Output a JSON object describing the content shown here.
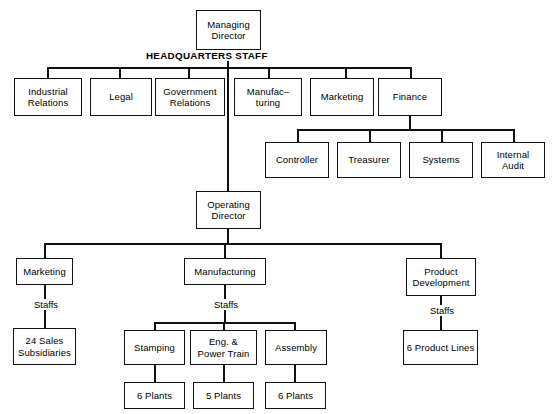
{
  "chart": {
    "type": "org-chart",
    "headquarters_label": "HEADQUARTERS STAFF",
    "staff_label": "Staffs",
    "nodes": {
      "managing_director": "Managing\nDirector",
      "industrial_relations": "Industrial\nRelations",
      "legal": "Legal",
      "government_relations": "Government\nRelations",
      "manufacturing_hq": "Manufac–\nturing",
      "marketing_hq": "Marketing",
      "finance": "Finance",
      "controller": "Controller",
      "treasurer": "Treasurer",
      "systems": "Systems",
      "internal_audit": "Internal\nAudit",
      "operating_director": "Operating\nDirector",
      "marketing_ops": "Marketing",
      "manufacturing_ops": "Manufacturing",
      "product_development": "Product\nDevelopment",
      "sales_subsidiaries": "24 Sales\nSubsidiaries",
      "stamping": "Stamping",
      "eng_power_train": "Eng. &\nPower Train",
      "assembly": "Assembly",
      "product_lines": "6 Product Lines",
      "stamping_plants": "6 Plants",
      "eng_plants": "5 Plants",
      "assembly_plants": "6 Plants"
    },
    "staff_labels": {
      "marketing_staffs": "Staffs",
      "manufacturing_staffs": "Staffs",
      "product_dev_staffs": "Staffs"
    },
    "colors": {
      "line": "#111111",
      "box_fill": "#ffffff",
      "text": "#000000",
      "background": "#fefefe"
    }
  }
}
